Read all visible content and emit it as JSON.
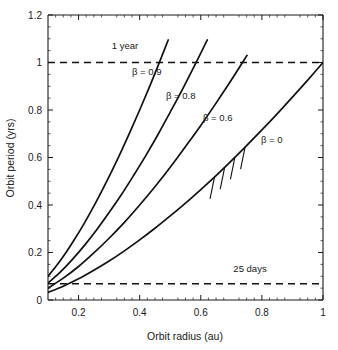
{
  "chart_data": {
    "type": "line",
    "title": "",
    "xlabel": "Orbit radius (au)",
    "ylabel": "Orbit period (yrs)",
    "xlim": [
      0.1,
      1.0
    ],
    "ylim": [
      0.0,
      1.2
    ],
    "xticks": [
      0.2,
      0.4,
      0.6,
      0.8,
      1
    ],
    "xticklabels": [
      "0.2",
      "0.4",
      "0.6",
      "0.8",
      "1"
    ],
    "yticks": [
      0,
      0.2,
      0.4,
      0.6,
      0.8,
      1,
      1.2
    ],
    "yticklabels": [
      "0",
      "0.2",
      "0.4",
      "0.6",
      "0.8",
      "1",
      "1.2"
    ],
    "grid": false,
    "legend": "inline-curve-labels",
    "relation": "P = r^1.5 / sqrt(1 - beta)",
    "series": [
      {
        "name": "beta = 0",
        "beta": 0,
        "label": "β = 0",
        "x": [
          0.1,
          0.15,
          0.2,
          0.25,
          0.3,
          0.35,
          0.4,
          0.45,
          0.5,
          0.55,
          0.6,
          0.65,
          0.7,
          0.75,
          0.8,
          0.85,
          0.9,
          0.95,
          1.0
        ],
        "y": [
          0.032,
          0.058,
          0.089,
          0.125,
          0.164,
          0.207,
          0.253,
          0.302,
          0.354,
          0.408,
          0.465,
          0.524,
          0.586,
          0.65,
          0.716,
          0.784,
          0.854,
          0.926,
          1.0
        ]
      },
      {
        "name": "beta = 0.6",
        "beta": 0.6,
        "label": "β = 0.6",
        "x": [
          0.1,
          0.15,
          0.2,
          0.25,
          0.3,
          0.35,
          0.4,
          0.45,
          0.5,
          0.55,
          0.6,
          0.65,
          0.7,
          0.7513
        ],
        "y": [
          0.05,
          0.092,
          0.141,
          0.198,
          0.26,
          0.327,
          0.4,
          0.477,
          0.559,
          0.646,
          0.735,
          0.829,
          0.926,
          1.03
        ]
      },
      {
        "name": "beta = 0.8",
        "beta": 0.8,
        "label": "β = 0.8",
        "x": [
          0.1,
          0.14,
          0.18,
          0.22,
          0.26,
          0.3,
          0.34,
          0.38,
          0.42,
          0.46,
          0.5,
          0.54,
          0.58,
          0.6213
        ],
        "y": [
          0.071,
          0.117,
          0.171,
          0.231,
          0.297,
          0.368,
          0.443,
          0.524,
          0.608,
          0.697,
          0.791,
          0.887,
          0.988,
          1.095
        ]
      },
      {
        "name": "beta = 0.9",
        "beta": 0.9,
        "label": "β = 0.9",
        "x": [
          0.1,
          0.13,
          0.16,
          0.19,
          0.22,
          0.25,
          0.28,
          0.31,
          0.34,
          0.37,
          0.4,
          0.43,
          0.46,
          0.4934
        ],
        "y": [
          0.1,
          0.148,
          0.202,
          0.262,
          0.326,
          0.395,
          0.469,
          0.546,
          0.627,
          0.712,
          0.8,
          0.891,
          0.986,
          1.095
        ]
      }
    ],
    "reference_lines": [
      {
        "name": "one-year-line",
        "label": "1 year",
        "y": 1.0,
        "style": "dashed"
      },
      {
        "name": "twentyfive-days-line",
        "label": "25 days",
        "y": 0.0685,
        "style": "dashed"
      }
    ],
    "hatch_region": {
      "name": "forbidden-hatching",
      "along_series": "beta = 0",
      "marks": 4,
      "x_start": 0.645,
      "x_end": 0.745
    }
  },
  "labels": {
    "xaxis": "Orbit radius (au)",
    "yaxis": "Orbit period (yrs)",
    "one_year": "1 year",
    "twentyfive_days": "25 days",
    "beta_0": "β = 0",
    "beta_06": "β = 0.6",
    "beta_08": "β = 0.8",
    "beta_09": "β = 0.9"
  },
  "colors": {
    "curve": "#111111",
    "axis": "#1a1a1a",
    "dashed": "#111111",
    "background": "#ffffff"
  }
}
